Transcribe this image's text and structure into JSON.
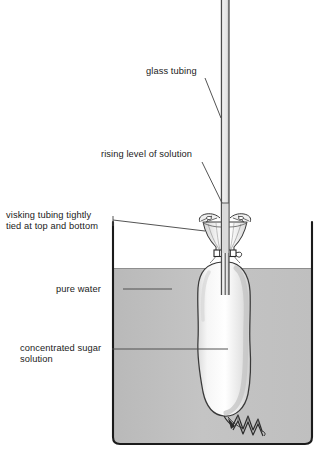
{
  "diagram": {
    "labels": {
      "glass_tubing": "glass tubing",
      "rising_level": "rising level of solution",
      "visking_tubing": "visking tubing tightly\ntied at top and bottom",
      "pure_water": "pure water",
      "sugar_solution": "concentrated sugar\nsolution"
    },
    "colors": {
      "ink": "#1b1b1b",
      "outline": "#3a3a3a",
      "water_fill": "#bdbdbd",
      "water_fill_light": "#c9c9c9",
      "bag_fill": "#f2f2f2",
      "bag_shade": "#d8d8d8",
      "tube_fill": "#ededed",
      "background": "#ffffff",
      "leader": "#4a4a4a"
    },
    "parts": {
      "beaker": "beaker",
      "water_surface": "water-surface",
      "glass_tube": "glass-tube",
      "visking_bag": "visking-bag",
      "top_tie": "top-tie-band",
      "bottom_tie": "bottom-tie-twist",
      "flared_rim": "flared-rim",
      "solution_column": "solution-column-in-tube"
    }
  }
}
